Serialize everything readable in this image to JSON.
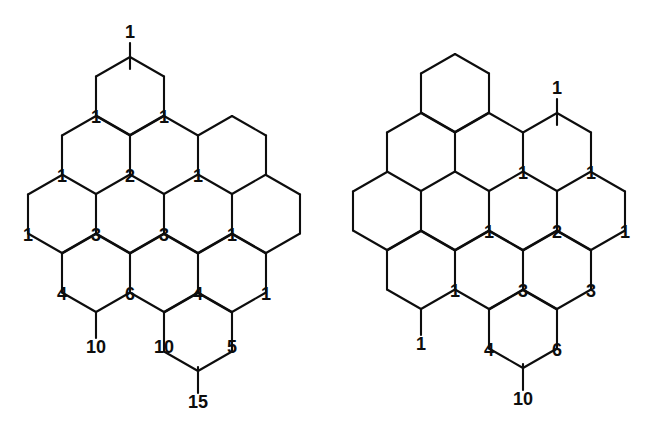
{
  "document": {
    "title": "Hexagonal Pascal Lattice Figures",
    "figure_count": 2,
    "stroke_color": "#0d0d0d",
    "background_color": "#ffffff",
    "label_color": "#0d0d0d"
  },
  "chart_data": {
    "type": "diagram",
    "subtype": "hexagonal-lattice-pascal-triangle",
    "title": "",
    "figures": [
      {
        "name": "left-figure",
        "hex_radius": 39,
        "hex_half_width": 34,
        "hex_centers": [
          {
            "id": "L-r0-c0",
            "cx": 130,
            "cy": 96
          },
          {
            "id": "L-r1-c0",
            "cx": 96,
            "cy": 155
          },
          {
            "id": "L-r1-c1",
            "cx": 164,
            "cy": 155
          },
          {
            "id": "L-r1-c2",
            "cx": 232,
            "cy": 155
          },
          {
            "id": "L-r2-c0",
            "cx": 62,
            "cy": 214
          },
          {
            "id": "L-r2-c1",
            "cx": 130,
            "cy": 214
          },
          {
            "id": "L-r2-c2",
            "cx": 198,
            "cy": 214
          },
          {
            "id": "L-r2-c3",
            "cx": 266,
            "cy": 214
          },
          {
            "id": "L-r3-c0",
            "cx": 96,
            "cy": 273
          },
          {
            "id": "L-r3-c1",
            "cx": 164,
            "cy": 273
          },
          {
            "id": "L-r3-c2",
            "cx": 232,
            "cy": 273
          },
          {
            "id": "L-r4-c0",
            "cx": 198,
            "cy": 332
          }
        ],
        "vertex_labels": [
          {
            "value": "1",
            "x": 130,
            "y": 33,
            "kind": "outer-top-stem"
          },
          {
            "value": "1",
            "x": 96,
            "y": 118,
            "kind": "vertex"
          },
          {
            "value": "1",
            "x": 164,
            "y": 118,
            "kind": "vertex"
          },
          {
            "value": "1",
            "x": 62,
            "y": 177,
            "kind": "vertex"
          },
          {
            "value": "2",
            "x": 130,
            "y": 177,
            "kind": "vertex"
          },
          {
            "value": "1",
            "x": 198,
            "y": 177,
            "kind": "vertex"
          },
          {
            "value": "1",
            "x": 28,
            "y": 236,
            "kind": "vertex"
          },
          {
            "value": "3",
            "x": 96,
            "y": 236,
            "kind": "vertex"
          },
          {
            "value": "3",
            "x": 164,
            "y": 236,
            "kind": "vertex"
          },
          {
            "value": "1",
            "x": 232,
            "y": 236,
            "kind": "vertex"
          },
          {
            "value": "4",
            "x": 62,
            "y": 295,
            "kind": "vertex"
          },
          {
            "value": "6",
            "x": 130,
            "y": 295,
            "kind": "vertex"
          },
          {
            "value": "4",
            "x": 198,
            "y": 295,
            "kind": "vertex"
          },
          {
            "value": "1",
            "x": 266,
            "y": 295,
            "kind": "vertex"
          },
          {
            "value": "10",
            "x": 96,
            "y": 348,
            "kind": "outer-bottom-stem"
          },
          {
            "value": "10",
            "x": 164,
            "y": 348,
            "kind": "vertex"
          },
          {
            "value": "5",
            "x": 232,
            "y": 348,
            "kind": "vertex"
          },
          {
            "value": "15",
            "x": 198,
            "y": 403,
            "kind": "outer-bottom-stem"
          }
        ],
        "pascal_rows": [
          [
            "1"
          ],
          [
            "1",
            "1"
          ],
          [
            "1",
            "2",
            "1"
          ],
          [
            "1",
            "3",
            "3",
            "1"
          ],
          [
            "4",
            "6",
            "4",
            "1"
          ],
          [
            "10",
            "10",
            "5"
          ],
          [
            "15"
          ]
        ]
      },
      {
        "name": "right-figure",
        "hex_radius": 39,
        "hex_half_width": 34,
        "hex_centers": [
          {
            "id": "R-r0-c0",
            "cx": 129,
            "cy": 93
          },
          {
            "id": "R-r1-c0",
            "cx": 95,
            "cy": 152
          },
          {
            "id": "R-r1-c1",
            "cx": 163,
            "cy": 152
          },
          {
            "id": "R-r1-c2",
            "cx": 231,
            "cy": 152
          },
          {
            "id": "R-r2-c0",
            "cx": 61,
            "cy": 211
          },
          {
            "id": "R-r2-c1",
            "cx": 129,
            "cy": 211
          },
          {
            "id": "R-r2-c2",
            "cx": 197,
            "cy": 211
          },
          {
            "id": "R-r2-c3",
            "cx": 265,
            "cy": 211
          },
          {
            "id": "R-r3-c0",
            "cx": 95,
            "cy": 270
          },
          {
            "id": "R-r3-c1",
            "cx": 163,
            "cy": 270
          },
          {
            "id": "R-r3-c2",
            "cx": 231,
            "cy": 270
          },
          {
            "id": "R-r4-c0",
            "cx": 197,
            "cy": 329
          }
        ],
        "vertex_labels": [
          {
            "value": "1",
            "x": 231,
            "y": 89,
            "kind": "outer-top-stem"
          },
          {
            "value": "1",
            "x": 197,
            "y": 174,
            "kind": "vertex"
          },
          {
            "value": "1",
            "x": 265,
            "y": 174,
            "kind": "vertex"
          },
          {
            "value": "1",
            "x": 163,
            "y": 233,
            "kind": "vertex"
          },
          {
            "value": "2",
            "x": 231,
            "y": 233,
            "kind": "vertex"
          },
          {
            "value": "1",
            "x": 299,
            "y": 233,
            "kind": "vertex"
          },
          {
            "value": "1",
            "x": 129,
            "y": 292,
            "kind": "vertex"
          },
          {
            "value": "3",
            "x": 197,
            "y": 292,
            "kind": "vertex"
          },
          {
            "value": "3",
            "x": 265,
            "y": 292,
            "kind": "vertex"
          },
          {
            "value": "1",
            "x": 95,
            "y": 345,
            "kind": "outer-bottom-stem"
          },
          {
            "value": "4",
            "x": 163,
            "y": 351,
            "kind": "vertex"
          },
          {
            "value": "6",
            "x": 231,
            "y": 351,
            "kind": "vertex"
          },
          {
            "value": "10",
            "x": 197,
            "y": 400,
            "kind": "outer-bottom-stem"
          }
        ],
        "pascal_rows": [
          [
            "1"
          ],
          [
            "1",
            "1"
          ],
          [
            "1",
            "2",
            "1"
          ],
          [
            "1",
            "3",
            "3"
          ],
          [
            "1",
            "4",
            "6"
          ],
          [
            "10"
          ]
        ]
      }
    ]
  },
  "left_figure": {
    "caption": "",
    "numbers": [
      "1",
      "1",
      "1",
      "1",
      "2",
      "1",
      "1",
      "3",
      "3",
      "1",
      "4",
      "6",
      "4",
      "1",
      "10",
      "10",
      "5",
      "15"
    ]
  },
  "right_figure": {
    "caption": "",
    "numbers": [
      "1",
      "1",
      "1",
      "1",
      "2",
      "1",
      "1",
      "3",
      "3",
      "1",
      "4",
      "6",
      "10"
    ]
  }
}
